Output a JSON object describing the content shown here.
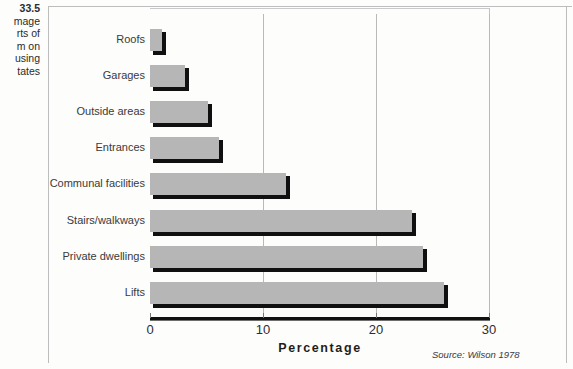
{
  "figure": {
    "caption_number": "33.5",
    "caption_lines": [
      "mage",
      "rts of",
      "m on",
      "using",
      "tates"
    ],
    "source_note": "Source: Wilson 1978"
  },
  "colors": {
    "bar_fill": "#b6b6b6",
    "bar_shadow": "#101010",
    "gridline": "#b9b9b9",
    "axis": "#111111",
    "frame": "#bdbdbd",
    "text": "#2e2e2e"
  },
  "chart_data": {
    "type": "bar",
    "orientation": "horizontal",
    "title": "",
    "xlabel": "Percentage",
    "ylabel": "",
    "xlim": [
      0,
      30
    ],
    "xticks": [
      0,
      10,
      20,
      30
    ],
    "xtick_labels": [
      "0",
      "10",
      "20",
      "30"
    ],
    "grid": true,
    "legend": null,
    "categories": [
      "Roofs",
      "Garages",
      "Outside areas",
      "Entrances",
      "Communal facilities",
      "Stairs/walkways",
      "Private dwellings",
      "Lifts"
    ],
    "values": [
      1.1,
      3.1,
      5.1,
      6.1,
      12.0,
      23.2,
      24.2,
      26.0
    ],
    "annotations": [
      "Source: Wilson 1978"
    ]
  }
}
